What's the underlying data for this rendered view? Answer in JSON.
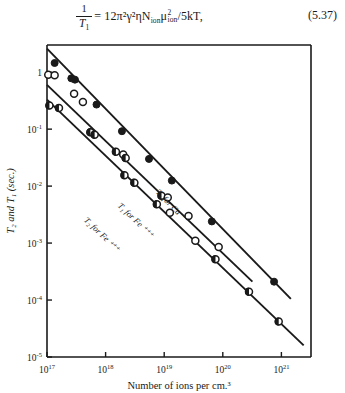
{
  "equation": {
    "number": "(5.37)",
    "lhs_numerator": "1",
    "lhs_denominator": "T",
    "lhs_denominator_sub": "1",
    "rhs": "= 12π²γ²ηN",
    "rhs_sub1": "ion",
    "rhs_mu": "μ",
    "rhs_mu_sup": "2",
    "rhs_mu_sub": "ion",
    "rhs_tail": "/5kT,",
    "plain_text": "1/T1 = 12π²γ²ηN_ion μ²_ion / 5kT,"
  },
  "chart_data": {
    "type": "scatter",
    "title": "",
    "xlabel": "Number of ions per cm.³",
    "ylabel": "T₂ and T₁ (sec.)",
    "xscale": "log",
    "yscale": "log",
    "xlim": [
      1e+17,
      3.2e+21
    ],
    "ylim": [
      1e-05,
      3.0
    ],
    "grid": false,
    "legend_position": "inline-labels",
    "xticks": [
      {
        "value": 1e+17,
        "label": "10",
        "exp": "17"
      },
      {
        "value": 1e+18,
        "label": "10",
        "exp": "18"
      },
      {
        "value": 1e+19,
        "label": "10",
        "exp": "19"
      },
      {
        "value": 1e+20,
        "label": "10",
        "exp": "20"
      },
      {
        "value": 1e+21,
        "label": "10",
        "exp": "21"
      }
    ],
    "yticks": [
      {
        "value": 1,
        "label": "1",
        "exp": ""
      },
      {
        "value": 0.1,
        "label": "10",
        "exp": "-1"
      },
      {
        "value": 0.01,
        "label": "10",
        "exp": "-2"
      },
      {
        "value": 0.001,
        "label": "10",
        "exp": "-3"
      },
      {
        "value": 0.0001,
        "label": "10",
        "exp": "-4"
      },
      {
        "value": 1e-05,
        "label": "10",
        "exp": "-5"
      }
    ],
    "series": [
      {
        "name": "T1 for Cu++",
        "annotation": "T₁ for Cu ⁺⁺",
        "marker": "filled-circle",
        "color": "#1a1a1a",
        "fit_line": {
          "x": [
            1e+17,
            1.45e+21
          ],
          "y": [
            2.6,
            0.000105
          ]
        },
        "points": [
          {
            "x": 1.35e+17,
            "y": 1.45,
            "marker": "filled-circle"
          },
          {
            "x": 2.6e+17,
            "y": 0.78,
            "marker": "filled-circle"
          },
          {
            "x": 3e+17,
            "y": 0.74,
            "marker": "filled-circle"
          },
          {
            "x": 7e+17,
            "y": 0.27,
            "marker": "filled-circle"
          },
          {
            "x": 1.9e+18,
            "y": 0.092,
            "marker": "filled-circle"
          },
          {
            "x": 5.5e+18,
            "y": 0.03,
            "marker": "filled-circle"
          },
          {
            "x": 1.35e+19,
            "y": 0.0125,
            "marker": "filled-circle"
          },
          {
            "x": 6.5e+19,
            "y": 0.0024,
            "marker": "filled-circle"
          },
          {
            "x": 7.5e+20,
            "y": 0.00021,
            "marker": "filled-circle"
          }
        ]
      },
      {
        "name": "T1 for Fe+++",
        "annotation": "T₁ for Fe ⁺⁺⁺",
        "marker": "open-circle",
        "color": "#1a1a1a",
        "fit_line": {
          "x": [
            1e+17,
            3.2e+20
          ],
          "y": [
            0.6,
            0.00021
          ]
        },
        "points": [
          {
            "x": 1.05e+17,
            "y": 0.9,
            "marker": "open-circle"
          },
          {
            "x": 1.35e+17,
            "y": 0.88,
            "marker": "open-circle"
          },
          {
            "x": 2.9e+17,
            "y": 0.42,
            "marker": "open-circle"
          },
          {
            "x": 4.1e+17,
            "y": 0.3,
            "marker": "open-circle"
          },
          {
            "x": 1.5e+18,
            "y": 0.04,
            "marker": "half-filled-circle"
          },
          {
            "x": 2e+18,
            "y": 0.036,
            "marker": "open-circle"
          },
          {
            "x": 2.2e+18,
            "y": 0.031,
            "marker": "half-filled-circle"
          },
          {
            "x": 9e+18,
            "y": 0.0068,
            "marker": "half-filled-circle"
          },
          {
            "x": 1.15e+19,
            "y": 0.0063,
            "marker": "open-circle"
          },
          {
            "x": 2.6e+19,
            "y": 0.003,
            "marker": "open-circle"
          },
          {
            "x": 8.5e+19,
            "y": 0.00085,
            "marker": "open-circle"
          }
        ]
      },
      {
        "name": "T2 for Fe+++",
        "annotation": "T₂ for Fe ⁺⁺⁺",
        "marker": "open-circle",
        "color": "#1a1a1a",
        "fit_line": {
          "x": [
            1e+17,
            2.4e+21
          ],
          "y": [
            0.33,
            1.6e-05
          ]
        },
        "points": [
          {
            "x": 1.1e+17,
            "y": 0.26,
            "marker": "half-filled-circle"
          },
          {
            "x": 1.6e+17,
            "y": 0.235,
            "marker": "half-filled-circle"
          },
          {
            "x": 5.5e+17,
            "y": 0.088,
            "marker": "half-filled-circle"
          },
          {
            "x": 6.5e+17,
            "y": 0.08,
            "marker": "half-filled-circle"
          },
          {
            "x": 2.1e+18,
            "y": 0.0155,
            "marker": "half-filled-circle"
          },
          {
            "x": 3.1e+18,
            "y": 0.0115,
            "marker": "half-filled-circle"
          },
          {
            "x": 7.5e+18,
            "y": 0.0048,
            "marker": "half-filled-circle"
          },
          {
            "x": 1.25e+19,
            "y": 0.0034,
            "marker": "open-circle"
          },
          {
            "x": 3.4e+19,
            "y": 0.0011,
            "marker": "open-circle"
          },
          {
            "x": 7.5e+19,
            "y": 0.00052,
            "marker": "half-filled-circle"
          },
          {
            "x": 2.8e+20,
            "y": 0.00014,
            "marker": "half-filled-circle"
          },
          {
            "x": 9e+20,
            "y": 4.2e-05,
            "marker": "half-filled-circle"
          }
        ]
      }
    ]
  }
}
